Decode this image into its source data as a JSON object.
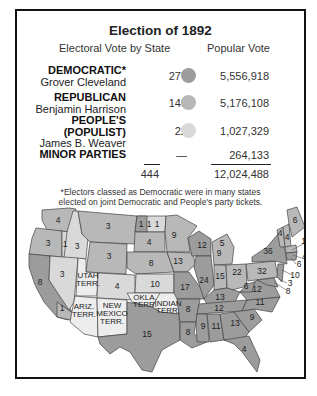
{
  "title": "Election of 1892",
  "headers": {
    "electoral": "Electoral Vote by State",
    "popular": "Popular Vote"
  },
  "colors": {
    "democratic": "#9c9c9c",
    "republican": "#b8b8b8",
    "populist": "#d9d9d9",
    "neutral": "#ededed"
  },
  "parties": [
    {
      "party": "DEMOCRATIC*",
      "candidate": "Grover Cleveland",
      "electoral": "277",
      "popular": "5,556,918"
    },
    {
      "party": "REPUBLICAN",
      "candidate": "Benjamin Harrison",
      "electoral": "145",
      "popular": "5,176,108"
    },
    {
      "party": "PEOPLE'S",
      "party2": "(POPULIST)",
      "candidate": "James B. Weaver",
      "electoral": "22",
      "popular": "1,027,329"
    },
    {
      "party": "MINOR PARTIES",
      "electoral": "—",
      "popular": "264,133"
    }
  ],
  "totals": {
    "electoral": "444",
    "popular": "12,024,488"
  },
  "footnote": {
    "line1": "*Electors classed as Democratic were in many states",
    "line2": "elected on joint Democratic and People's party tickets."
  },
  "map": {
    "labels": {
      "WA": "4",
      "OR": "3",
      "OR_pop": "1",
      "ID": "3",
      "MT": "3",
      "WY": "3",
      "CA": "8",
      "CA_pop": "1",
      "NV": "3",
      "UT": "UTAH",
      "UT2": "TERR.",
      "CO": "4",
      "AZ": "ARIZ.",
      "AZ2": "TERR.",
      "NM": "NEW",
      "NM2": "MEXICO",
      "NM3": "TERR.",
      "ND1": "1",
      "ND2": "1",
      "ND3": "1",
      "SD": "4",
      "NE": "8",
      "KS": "10",
      "OK": "OKLA.",
      "OK2": "TERR.",
      "IT": "INDIAN",
      "IT2": "TERR.",
      "TX": "15",
      "MN": "9",
      "IA": "13",
      "MO": "17",
      "AR": "8",
      "LA": "8",
      "WI": "12",
      "IL": "24",
      "MI1": "5",
      "MI2": "9",
      "IN": "15",
      "OH": "22",
      "KY": "13",
      "TN": "12",
      "MS": "9",
      "AL": "11",
      "GA": "13",
      "FL": "4",
      "SC": "9",
      "NC": "11",
      "VA": "12",
      "WV": "6",
      "PA": "32",
      "NY": "36",
      "VT": "4",
      "NH": "4",
      "ME": "6",
      "MA": "15",
      "RI": "4",
      "CT": "6",
      "NJ": "10",
      "DE": "3",
      "MD": "8",
      "OH2": "1"
    }
  }
}
